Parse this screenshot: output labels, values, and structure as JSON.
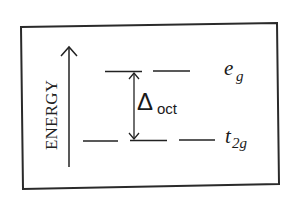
{
  "diagram": {
    "axis": {
      "label": "ENERGY",
      "direction": "up",
      "icon": "arrow-up-icon"
    },
    "levels": [
      {
        "id": "eg",
        "label_main": "e",
        "label_sub": "g",
        "position": "upper",
        "segments": 2
      },
      {
        "id": "t2g",
        "label_main": "t",
        "label_sub": "2g",
        "position": "lower",
        "segments": 3
      }
    ],
    "splitting": {
      "symbol": "Δ",
      "subscript": "oct",
      "icon": "double-arrow-vertical-icon"
    },
    "colors": {
      "ink": "#1a1a1a",
      "frame": "#2a2a2a",
      "background": "#ffffff"
    }
  }
}
